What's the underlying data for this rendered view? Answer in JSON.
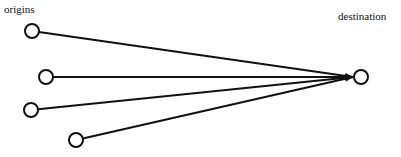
{
  "diagram": {
    "labels": {
      "origins": "origins",
      "destination": "destination"
    },
    "colors": {
      "stroke": "#111111",
      "background": "#ffffff",
      "node_fill": "#ffffff"
    },
    "origin_nodes": [
      {
        "id": "origin-1",
        "cx": 32,
        "cy": 31
      },
      {
        "id": "origin-2",
        "cx": 46,
        "cy": 77
      },
      {
        "id": "origin-3",
        "cx": 31,
        "cy": 110
      },
      {
        "id": "origin-4",
        "cx": 76,
        "cy": 140
      }
    ],
    "destination_node": {
      "id": "destination",
      "cx": 361,
      "cy": 77
    },
    "node_radius": 7,
    "arrow_tip": {
      "x": 353,
      "y": 77
    }
  }
}
